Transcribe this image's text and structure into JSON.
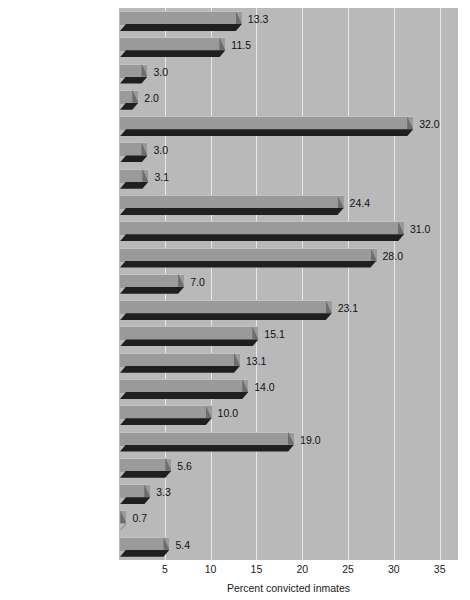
{
  "chart_data": {
    "type": "bar",
    "orientation": "horizontal",
    "title": "",
    "xlabel": "Percent convicted inmates",
    "ylabel": "",
    "xlim": [
      0,
      37
    ],
    "xticks": [
      5,
      10,
      15,
      20,
      25,
      30,
      35
    ],
    "xtick_labels": [
      "5",
      "10",
      "15",
      "20",
      "25",
      "30",
      "35"
    ],
    "grid": true,
    "legend": false,
    "categories": [
      "All Offenses",
      "Violent Offenses",
      "Homicide",
      "Sexual assault",
      "Robbery",
      "Assault",
      "Other violent",
      "Property Offenses",
      "Burglary",
      "Larceny-theft",
      "Motor vehicle theft",
      "Fraud",
      "Stolen property",
      "Other property",
      "Drug Offenses",
      "Possession",
      "Trafficking",
      "Other/unspecified",
      "Public Order Offenses",
      "DWI",
      "Other Public Order"
    ],
    "values": [
      13.3,
      11.5,
      3.0,
      2.0,
      32.0,
      3.0,
      3.1,
      24.4,
      31.0,
      28.0,
      7.0,
      23.1,
      15.1,
      13.1,
      14.0,
      10.0,
      19.0,
      5.6,
      3.3,
      0.7,
      5.4
    ],
    "rows": [
      {
        "label": "All Offenses",
        "footnote": "",
        "value": 13.3,
        "value_label": "13.3",
        "bold": true
      },
      {
        "label": "Violent Offenses",
        "footnote": "",
        "value": 11.5,
        "value_label": "11.5",
        "bold": true
      },
      {
        "label": "Homicide",
        "footnote": "a",
        "value": 3.0,
        "value_label": "3.0",
        "bold": false
      },
      {
        "label": "Sexual assault",
        "footnote": "b",
        "value": 2.0,
        "value_label": "2.0",
        "bold": false
      },
      {
        "label": "Robbery",
        "footnote": "",
        "value": 32.0,
        "value_label": "32.0",
        "bold": false
      },
      {
        "label": "Assault",
        "footnote": "",
        "value": 3.0,
        "value_label": "3.0",
        "bold": false
      },
      {
        "label": "Other violent",
        "footnote": "c",
        "value": 3.1,
        "value_label": "3.1",
        "bold": false
      },
      {
        "label": "Property Offenses",
        "footnote": "",
        "value": 24.4,
        "value_label": "24.4",
        "bold": true
      },
      {
        "label": "Burglary",
        "footnote": "",
        "value": 31.0,
        "value_label": "31.0",
        "bold": false
      },
      {
        "label": "Larceny-theft",
        "footnote": "",
        "value": 28.0,
        "value_label": "28.0",
        "bold": false
      },
      {
        "label": "Motor vehicle theft",
        "footnote": "",
        "value": 7.0,
        "value_label": "7.0",
        "bold": false
      },
      {
        "label": "Fraud",
        "footnote": "",
        "value": 23.1,
        "value_label": "23.1",
        "bold": false
      },
      {
        "label": "Stolen property",
        "footnote": "",
        "value": 15.1,
        "value_label": "15.1",
        "bold": false
      },
      {
        "label": "Other property",
        "footnote": "d",
        "value": 13.1,
        "value_label": "13.1",
        "bold": false
      },
      {
        "label": "Drug Offenses",
        "footnote": "",
        "value": 14.0,
        "value_label": "14.0",
        "bold": true
      },
      {
        "label": "Possession",
        "footnote": "",
        "value": 10.0,
        "value_label": "10.0",
        "bold": false
      },
      {
        "label": "Trafficking",
        "footnote": "",
        "value": 19.0,
        "value_label": "19.0",
        "bold": false
      },
      {
        "label": "Other/unspecified",
        "footnote": "",
        "value": 5.6,
        "value_label": "5.6",
        "bold": false
      },
      {
        "label": "Public Order Offenses",
        "footnote": "",
        "value": 3.3,
        "value_label": "3.3",
        "bold": true
      },
      {
        "label": "DWI",
        "footnote": "",
        "value": 0.7,
        "value_label": "0.7",
        "bold": false
      },
      {
        "label": "Other Public Order",
        "footnote": "",
        "value": 5.4,
        "value_label": "5.4",
        "bold": true
      }
    ],
    "colors": {
      "plot_background": "#b9b9b9",
      "gridline": "#e8e8e8",
      "bar_top_face": "#9a9a9a",
      "bar_front_face": "#1f1f1f",
      "bar_side_face": "#6d6d6d",
      "text": "#1a1a1a",
      "figure_background": "#ffffff"
    }
  }
}
